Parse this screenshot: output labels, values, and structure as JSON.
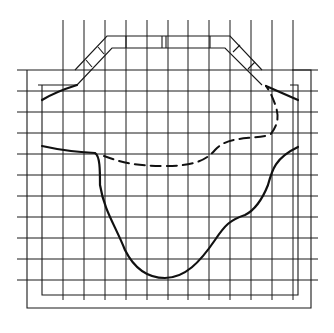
{
  "diagram": {
    "type": "grid-cross-section",
    "colors": {
      "line": "#1a1a1a",
      "background": "#ffffff"
    },
    "grid": {
      "vertical_x": [
        63,
        84,
        105,
        126,
        147,
        168,
        188,
        209,
        230,
        251,
        272,
        293
      ],
      "horizontal_y": [
        70,
        91,
        112,
        133,
        154,
        175,
        196,
        217,
        238,
        259,
        280
      ],
      "v_extent": [
        20,
        300
      ],
      "h_extent": [
        17,
        318
      ]
    },
    "curves": {
      "solid_lower": "outer profile (solid)",
      "dashed_upper": "inner profile (dashed)"
    }
  }
}
